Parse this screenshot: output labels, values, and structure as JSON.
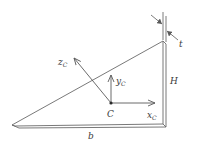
{
  "diagram": {
    "type": "thin triangular plate with centroidal axes",
    "labels": {
      "thickness": "t",
      "height": "H",
      "base": "b",
      "centroid": "C",
      "axis_x": "x",
      "axis_x_sub": "C",
      "axis_y": "y",
      "axis_y_sub": "C",
      "axis_z": "z",
      "axis_z_sub": "C"
    },
    "colors": {
      "line": "#5a5a5a",
      "text": "#3a3a3a",
      "background": "#ffffff"
    }
  }
}
